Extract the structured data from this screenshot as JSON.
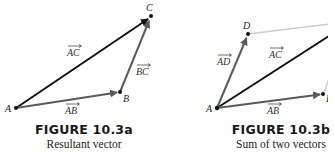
{
  "figures": [
    {
      "id": "10.3a",
      "title": "FIGURE 10.3a",
      "subtitle": "Resultant vector",
      "points": {
        "A": "A",
        "B": "B",
        "C": "C"
      },
      "vectors": {
        "AC": "AC",
        "BC": "BC",
        "AB": "AB"
      }
    },
    {
      "id": "10.3b",
      "title": "FIGURE 10.3b",
      "subtitle": "Sum of two vectors",
      "points": {
        "A": "A",
        "D": "D",
        "B": "B"
      },
      "vectors": {
        "AD": "AD",
        "AC": "AC",
        "AB": "AB"
      }
    }
  ],
  "colors": {
    "resultant": "#111111",
    "component": "#5a5a5a",
    "guide": "#cccccc"
  }
}
